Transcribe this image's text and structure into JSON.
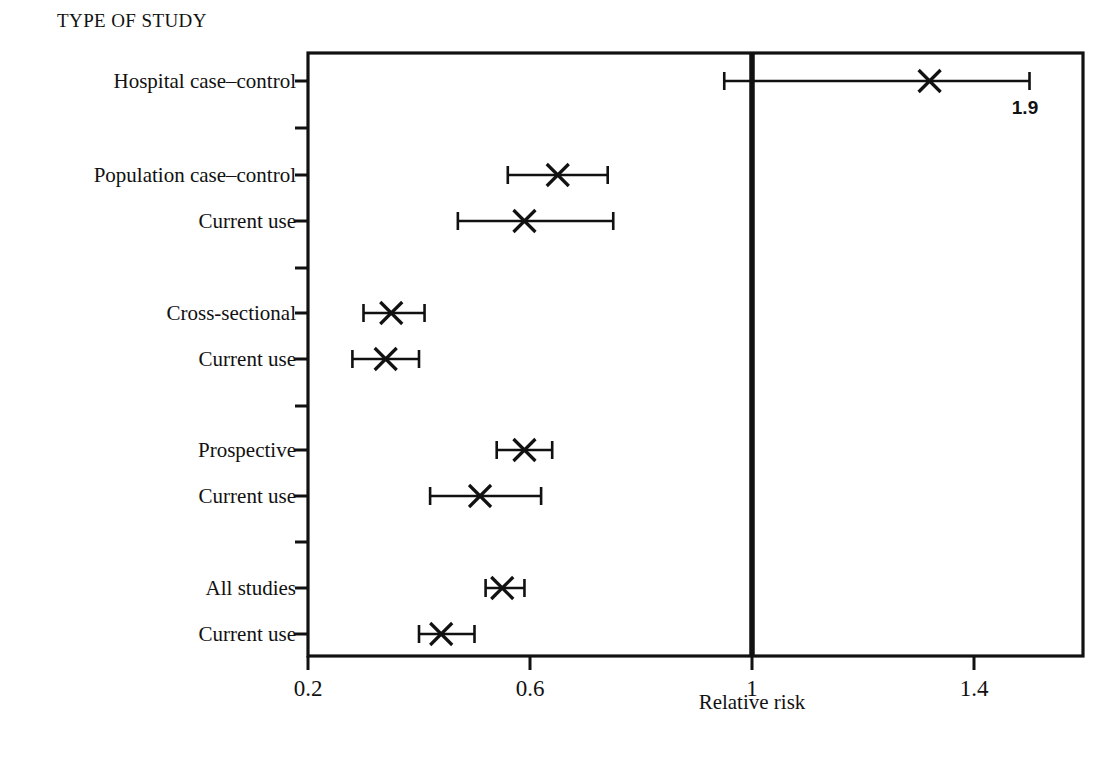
{
  "figure": {
    "group_title": "TYPE OF STUDY",
    "axis_title": "Relative risk",
    "annotation_label": "1.9",
    "line_color": "#111111",
    "background": "#ffffff"
  },
  "axis": {
    "tick_labels": [
      "0.2",
      "0.6",
      "1",
      "1.4"
    ],
    "tick_values": [
      0.2,
      0.6,
      1.0,
      1.4
    ]
  },
  "rows": [
    {
      "label": "Hospital case–control"
    },
    {
      "label": "Population case–control"
    },
    {
      "label": "Current use"
    },
    {
      "label": "Cross-sectional"
    },
    {
      "label": "Current use"
    },
    {
      "label": "Prospective"
    },
    {
      "label": "Current use"
    },
    {
      "label": "All studies"
    },
    {
      "label": "Current use"
    }
  ],
  "chart_data": {
    "type": "scatter",
    "title": "TYPE OF STUDY",
    "xlabel": "Relative risk",
    "ylabel": "",
    "xlim": [
      0.2,
      1.585
    ],
    "grid": false,
    "legend": "none",
    "reference_line": 1.0,
    "marker": "x",
    "categories": [
      "Hospital case–control",
      "Population case–control",
      "Current use",
      "Cross-sectional",
      "Current use",
      "Prospective",
      "Current use",
      "All studies",
      "Current use"
    ],
    "points": [
      {
        "category": "Hospital case–control",
        "estimate": 1.32,
        "ci_low": 0.95,
        "ci_high": 1.5,
        "ci_high_label": "1.9",
        "ci_high_truncated": true
      },
      {
        "category": "Population case–control",
        "estimate": 0.65,
        "ci_low": 0.56,
        "ci_high": 0.74,
        "ci_high_label": null,
        "ci_high_truncated": false
      },
      {
        "category": "Current use",
        "estimate": 0.59,
        "ci_low": 0.47,
        "ci_high": 0.75,
        "ci_high_label": null,
        "ci_high_truncated": false
      },
      {
        "category": "Cross-sectional",
        "estimate": 0.35,
        "ci_low": 0.3,
        "ci_high": 0.41,
        "ci_high_label": null,
        "ci_high_truncated": false
      },
      {
        "category": "Current use",
        "estimate": 0.34,
        "ci_low": 0.28,
        "ci_high": 0.4,
        "ci_high_label": null,
        "ci_high_truncated": false
      },
      {
        "category": "Prospective",
        "estimate": 0.59,
        "ci_low": 0.54,
        "ci_high": 0.64,
        "ci_high_label": null,
        "ci_high_truncated": false
      },
      {
        "category": "Current use",
        "estimate": 0.51,
        "ci_low": 0.42,
        "ci_high": 0.62,
        "ci_high_label": null,
        "ci_high_truncated": false
      },
      {
        "category": "All studies",
        "estimate": 0.55,
        "ci_low": 0.52,
        "ci_high": 0.59,
        "ci_high_label": null,
        "ci_high_truncated": false
      },
      {
        "category": "Current use",
        "estimate": 0.44,
        "ci_low": 0.4,
        "ci_high": 0.5,
        "ci_high_label": null,
        "ci_high_truncated": false
      }
    ],
    "row_tick_count": 13
  }
}
